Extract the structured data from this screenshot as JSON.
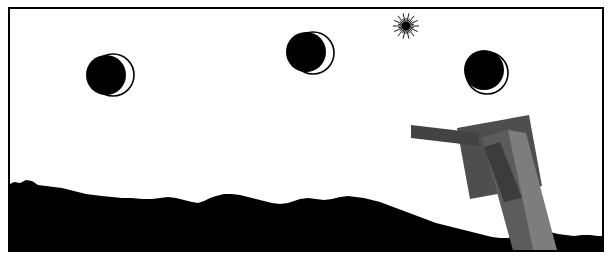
{
  "artwork": {
    "title": "Moon Phases Over Dark Horizon",
    "medium": "black and white illustration",
    "frame_color": "#000000",
    "background_color": "#ffffff",
    "silhouette_color": "#000000",
    "grey_dark": "#4a4a4a",
    "grey_mid": "#6b6b6b",
    "grey_light": "#8a8a8a"
  },
  "sky": {
    "label": "sky",
    "color": "#ffffff"
  },
  "moons": [
    {
      "name": "moon-waning-crescent-left",
      "label": "Moon 1",
      "cx": 111,
      "cy": 73,
      "r": 21,
      "shadow_cx": 104,
      "shadow_cy": 73,
      "shadow_r": 20,
      "phase": "waning gibbous with right crescent lit",
      "illuminated_side": "right"
    },
    {
      "name": "moon-waning-crescent-center",
      "label": "Moon 2",
      "cx": 311,
      "cy": 51,
      "r": 21,
      "shadow_cx": 304,
      "shadow_cy": 50,
      "shadow_r": 20,
      "phase": "waning gibbous with right crescent lit",
      "illuminated_side": "right"
    },
    {
      "name": "moon-nearly-new-right",
      "label": "Moon 3",
      "cx": 485,
      "cy": 71,
      "r": 21,
      "shadow_cx": 482,
      "shadow_cy": 68,
      "shadow_r": 20,
      "phase": "nearly new, thin lower-right sliver lit",
      "illuminated_side": "lower-right"
    }
  ],
  "sun": {
    "name": "sun-starburst",
    "label": "Starburst sun",
    "cx": 404,
    "cy": 24,
    "core_r": 4,
    "ray_count": 28,
    "ray_length_long": 13,
    "ray_length_short": 8,
    "color": "#000000"
  },
  "terrain": {
    "label": "Hilly horizon silhouette",
    "color": "#000000",
    "path": "M 0 185 L 6 183 L 12 180 L 18 181 L 24 178 L 30 179 L 36 183 L 44 184 L 52 185 L 60 186 L 68 188 L 76 190 L 84 192 L 92 193 L 100 194 L 110 195 L 120 196 L 130 196 L 140 197 L 150 197 L 158 196 L 166 195 L 174 196 L 182 198 L 190 200 L 196 201 L 202 199 L 208 196 L 214 194 L 222 192 L 230 192 L 238 193 L 246 195 L 254 197 L 262 199 L 270 201 L 278 202 L 286 201 L 292 199 L 298 197 L 306 196 L 314 197 L 322 198 L 330 197 L 338 195 L 346 194 L 354 195 L 362 196 L 370 198 L 378 200 L 386 203 L 394 206 L 402 209 L 410 212 L 418 215 L 426 218 L 434 221 L 442 223 L 450 225 L 458 227 L 466 229 L 474 231 L 482 233 L 490 235 L 498 236 L 506 236 L 514 234 L 520 231 L 526 228 L 532 227 L 540 228 L 548 230 L 556 232 L 564 233 L 572 234 L 580 233 L 588 233 L 596 234 L 613 234 L 613 260 L 0 260 Z"
  },
  "structure": {
    "label": "Grey signpost structure",
    "parts": [
      {
        "name": "sign-panel",
        "label": "Rotated sign panel",
        "color": "#4e4e4e",
        "points": "455,126 527,113 540,184 468,197"
      },
      {
        "name": "cross-arm",
        "label": "Horizontal cross arm",
        "color": "#434343",
        "points": "409,123 477,131 477,144 409,136"
      },
      {
        "name": "post-upper",
        "label": "Upper tapering post",
        "color": "#5c5c5c",
        "points": "480,136 506,128 540,252 512,252"
      },
      {
        "name": "post-lower",
        "label": "Lower post leg",
        "color": "#7d7d7d",
        "points": "506,128 524,131 556,252 532,252"
      },
      {
        "name": "post-shadowed-edge",
        "label": "Post inner shade",
        "color": "#3c3c3c",
        "points": "482,145 498,140 520,196 502,200"
      }
    ]
  }
}
